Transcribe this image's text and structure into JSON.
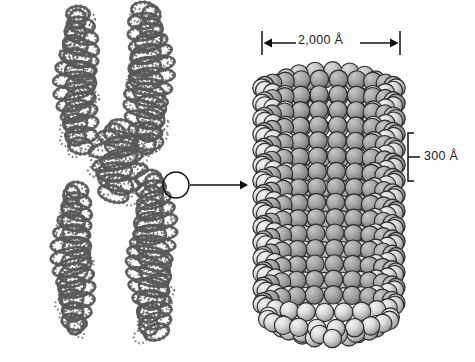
{
  "figure": {
    "background_color": "#fefefe",
    "ink_color": "#1a1a1a"
  },
  "chromosome": {
    "name": "metaphase-chromosome",
    "description": "Metaphase chromosome drawn as two sister chromatids of tightly coiled chromatin fiber joined at a centromere",
    "parts": [
      {
        "name": "upper-left-chromatid-arm"
      },
      {
        "name": "upper-right-chromatid-arm"
      },
      {
        "name": "centromere"
      },
      {
        "name": "lower-left-chromatid-arm"
      },
      {
        "name": "lower-right-chromatid-arm"
      }
    ],
    "fiber_color": "#585858"
  },
  "callout": {
    "name": "magnification-callout",
    "circle": {
      "cx": 176,
      "cy": 185,
      "r": 13
    },
    "arrow": {
      "x1": 190,
      "y1": 185,
      "x2": 246,
      "y2": 185
    }
  },
  "solenoid": {
    "name": "solenoid-chromatin-fiber",
    "description": "Cylindrical solenoid coil of nucleosome beads forming the 30-nm chromatin fiber",
    "bead_label": "nucleosome-bead",
    "bead_fill_light": "#e8e8e8",
    "bead_fill_dark": "#8d8d8d",
    "outline_color": "#2b2b2b",
    "bounds": {
      "left": 262,
      "right": 396,
      "top": 62,
      "bottom": 330
    }
  },
  "dimensions": {
    "width": {
      "name": "width-dimension",
      "label": "2,000 Å",
      "value": 2000,
      "unit": "Å",
      "orientation": "horizontal",
      "line": {
        "x1": 262,
        "x2": 400,
        "y": 43
      }
    },
    "height": {
      "name": "coil-pitch-dimension",
      "label": "300 Å",
      "value": 300,
      "unit": "Å",
      "orientation": "vertical",
      "bracket": {
        "x": 408,
        "y1": 133,
        "y2": 181
      }
    }
  }
}
